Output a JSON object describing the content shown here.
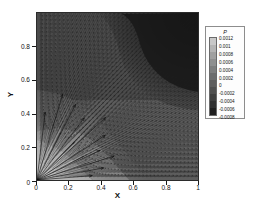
{
  "figure": {
    "kind": "contour-vector-plot",
    "background": "#ffffff"
  },
  "axes": {
    "x": {
      "label": "X",
      "ticks": [
        "0",
        "0.2",
        "0.4",
        "0.6",
        "0.8",
        "1"
      ],
      "range": [
        0,
        1
      ]
    },
    "y": {
      "label": "Y",
      "ticks": [
        "0",
        "0.2",
        "0.4",
        "0.6",
        "0.8"
      ],
      "range": [
        0,
        1
      ]
    }
  },
  "legend": {
    "title": "P",
    "labels": [
      "0.0012",
      "0.001",
      "0.0008",
      "0.0006",
      "0.0004",
      "0.0002",
      "0",
      "-0.0002",
      "-0.0004",
      "-0.0006",
      "-0.0008"
    ],
    "swatch_colors": [
      "#c8c8c8",
      "#b4b4b4",
      "#a0a0a0",
      "#8f8f8f",
      "#7e7e7e",
      "#6d6d6d",
      "#5e5e5e",
      "#4f4f4f",
      "#3f3f3f",
      "#303030",
      "#1f1f1f"
    ]
  },
  "chart_data": {
    "type": "heatmap",
    "title": "",
    "xlabel": "X",
    "ylabel": "Y",
    "xlim": [
      0,
      1
    ],
    "ylim": [
      0,
      1
    ],
    "grid": false,
    "legend_position": "right",
    "colorbar_label": "P",
    "colormap": "grayscale",
    "levels": [
      0.0012,
      0.001,
      0.0008,
      0.0006,
      0.0004,
      0.0002,
      0,
      -0.0002,
      -0.0004,
      -0.0006,
      -0.0008
    ],
    "level_colors": [
      "#c8c8c8",
      "#b4b4b4",
      "#a0a0a0",
      "#8f8f8f",
      "#7e7e7e",
      "#6d6d6d",
      "#5e5e5e",
      "#4f4f4f",
      "#3f3f3f",
      "#303030",
      "#1f1f1f"
    ],
    "overlay": {
      "type": "vector-field",
      "description": "uniform grid of velocity vectors with a strong radial jet emanating from the lower-left corner",
      "source_point": [
        0.0,
        0.0
      ],
      "grid_nx": 40,
      "grid_ny": 40
    },
    "regions": [
      {
        "name": "upper-right-low-pressure",
        "approx_center": [
          0.78,
          0.82
        ],
        "value": -0.0007
      },
      {
        "name": "upper-left-mid-pressure",
        "approx_center": [
          0.18,
          0.78
        ],
        "value": -0.0002
      },
      {
        "name": "lower-left-high-pressure",
        "approx_center": [
          0.12,
          0.18
        ],
        "value": 0.0011
      },
      {
        "name": "lower-right-mid-pressure",
        "approx_center": [
          0.8,
          0.2
        ],
        "value": 0.0
      },
      {
        "name": "diagonal-band",
        "approx_center": [
          0.42,
          0.3
        ],
        "value": 0.0006
      }
    ]
  }
}
